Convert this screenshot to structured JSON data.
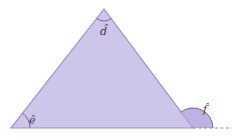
{
  "diagram": {
    "type": "triangle-angles",
    "fill_color": "#cdc6ea",
    "edge_color": "#9a90c8",
    "exterior_arc_fill": "#b6aadf",
    "dashed_line_color": "#8a86a0",
    "angles": [
      {
        "id": "d",
        "label": "d̂",
        "position": "top-vertex",
        "kind": "interior"
      },
      {
        "id": "e",
        "label": "ê",
        "position": "bottom-left-vertex",
        "kind": "interior"
      },
      {
        "id": "f",
        "label": "f̂",
        "position": "bottom-right-vertex",
        "kind": "exterior"
      }
    ]
  }
}
